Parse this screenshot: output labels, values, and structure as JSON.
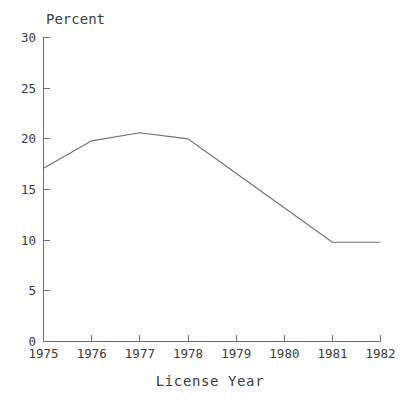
{
  "chart_data": {
    "type": "line",
    "title": "",
    "ylabel": "Percent",
    "xlabel": "License Year",
    "categories": [
      "1975",
      "1976",
      "1977",
      "1978",
      "1979",
      "1980",
      "1981",
      "1982"
    ],
    "x": [
      1975,
      1976,
      1977,
      1978,
      1979,
      1980,
      1981,
      1982
    ],
    "values": [
      17.1,
      19.8,
      20.6,
      20.0,
      16.6,
      13.2,
      9.8,
      9.8
    ],
    "series": [
      {
        "name": "Percent",
        "values": [
          17.1,
          19.8,
          20.6,
          20.0,
          16.6,
          13.2,
          9.8,
          9.8
        ]
      }
    ],
    "ylim": [
      0,
      30
    ],
    "xlim": [
      1975,
      1982
    ],
    "yticks": [
      0,
      5,
      10,
      15,
      20,
      25,
      30
    ],
    "ytick_labels": [
      "0",
      "5",
      "10",
      "15",
      "20",
      "25",
      "30"
    ],
    "xticks": [
      1975,
      1976,
      1977,
      1978,
      1979,
      1980,
      1981,
      1982
    ],
    "xtick_labels": [
      "1975",
      "1976",
      "1977",
      "1978",
      "1979",
      "1980",
      "1981",
      "1982"
    ],
    "grid": false,
    "legend": false,
    "legend_position": "none",
    "line_color": "#6e6e6e",
    "axis_color": "#6e6e6e",
    "text_color": "#3a3a3a",
    "background_color": "#ffffff"
  }
}
